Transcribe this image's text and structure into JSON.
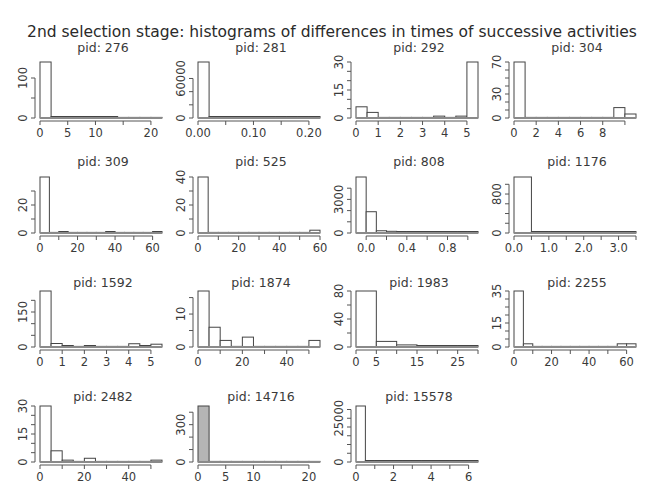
{
  "chart_data": {
    "type": "bar",
    "title": "2nd selection stage: histograms of differences in times of successive activities",
    "layout": {
      "rows": 4,
      "cols": 4,
      "grid": false,
      "legend": "none"
    },
    "panels": [
      {
        "title": "pid:  276",
        "xlim": [
          0,
          22
        ],
        "ylim": [
          0,
          140
        ],
        "xticks": [
          0,
          5,
          10,
          15,
          20
        ],
        "xtick_labels": [
          "0",
          "5",
          "10",
          "",
          "20"
        ],
        "yticks": [
          0,
          50,
          100
        ],
        "ytick_labels": [
          "0",
          "",
          "100"
        ],
        "bin_edges": [
          0,
          2,
          4,
          6,
          8,
          10,
          12,
          14,
          16,
          18,
          20,
          22
        ],
        "counts": [
          140,
          1,
          1,
          1,
          1,
          1,
          1,
          0,
          0,
          0,
          0
        ]
      },
      {
        "title": "pid:  281",
        "xlim": [
          0,
          0.22
        ],
        "ylim": [
          0,
          85000
        ],
        "xticks": [
          0,
          0.05,
          0.1,
          0.15,
          0.2
        ],
        "xtick_labels": [
          "0.00",
          "",
          "0.10",
          "",
          "0.20"
        ],
        "yticks": [
          0,
          20000,
          40000,
          60000
        ],
        "ytick_labels": [
          "0",
          "",
          "",
          "60000"
        ],
        "bin_edges": [
          0,
          0.02,
          0.04,
          0.06,
          0.08,
          0.1,
          0.12,
          0.14,
          0.16,
          0.18,
          0.2,
          0.22
        ],
        "counts": [
          85000,
          200,
          500,
          300,
          100,
          50,
          30,
          20,
          10,
          10,
          10
        ]
      },
      {
        "title": "pid:  292",
        "xlim": [
          0,
          5.5
        ],
        "ylim": [
          0,
          30
        ],
        "xticks": [
          0,
          1,
          2,
          3,
          4,
          5
        ],
        "xtick_labels": [
          "0",
          "1",
          "2",
          "3",
          "4",
          "5"
        ],
        "yticks": [
          0,
          5,
          10,
          15,
          20,
          25,
          30
        ],
        "ytick_labels": [
          "0",
          "",
          "",
          "15",
          "",
          "",
          "30"
        ],
        "bin_edges": [
          0,
          0.5,
          1,
          1.5,
          2,
          2.5,
          3,
          3.5,
          4,
          4.5,
          5,
          5.5
        ],
        "counts": [
          6,
          3,
          0,
          0,
          0,
          0,
          0,
          1,
          0,
          1,
          30
        ]
      },
      {
        "title": "pid:  304",
        "xlim": [
          0,
          11
        ],
        "ylim": [
          0,
          70
        ],
        "xticks": [
          0,
          2,
          4,
          6,
          8,
          10
        ],
        "xtick_labels": [
          "0",
          "2",
          "4",
          "6",
          "8",
          ""
        ],
        "yticks": [
          0,
          10,
          20,
          30,
          40,
          50,
          60,
          70
        ],
        "ytick_labels": [
          "0",
          "",
          "",
          "30",
          "",
          "",
          "",
          "70"
        ],
        "bin_edges": [
          0,
          1,
          2,
          3,
          4,
          5,
          6,
          7,
          8,
          9,
          10,
          11
        ],
        "counts": [
          70,
          0,
          0,
          0,
          0,
          0,
          0,
          0,
          0,
          13,
          5
        ]
      },
      {
        "title": "pid:  309",
        "xlim": [
          0,
          65
        ],
        "ylim": [
          0,
          40
        ],
        "xticks": [
          0,
          10,
          20,
          30,
          40,
          50,
          60
        ],
        "xtick_labels": [
          "0",
          "",
          "20",
          "",
          "40",
          "",
          "60"
        ],
        "yticks": [
          0,
          10,
          20,
          30
        ],
        "ytick_labels": [
          "0",
          "",
          "20",
          ""
        ],
        "bin_edges": [
          0,
          5,
          10,
          15,
          20,
          25,
          30,
          35,
          40,
          45,
          50,
          55,
          60,
          65
        ],
        "counts": [
          40,
          0,
          1,
          0,
          0,
          0,
          0,
          1,
          0,
          0,
          0,
          0,
          1
        ]
      },
      {
        "title": "pid:  525",
        "xlim": [
          0,
          60
        ],
        "ylim": [
          0,
          40
        ],
        "xticks": [
          0,
          10,
          20,
          30,
          40,
          50,
          60
        ],
        "xtick_labels": [
          "0",
          "",
          "20",
          "",
          "40",
          "",
          "60"
        ],
        "yticks": [
          0,
          10,
          20,
          30,
          40
        ],
        "ytick_labels": [
          "0",
          "",
          "20",
          "",
          "40"
        ],
        "bin_edges": [
          0,
          5,
          10,
          15,
          20,
          25,
          30,
          35,
          40,
          45,
          50,
          55,
          60
        ],
        "counts": [
          40,
          0,
          0,
          0,
          0,
          0,
          0,
          0,
          0,
          0,
          0,
          2
        ]
      },
      {
        "title": "pid:  808",
        "xlim": [
          -0.1,
          1.1
        ],
        "ylim": [
          0,
          5000
        ],
        "xticks": [
          0.0,
          0.2,
          0.4,
          0.6,
          0.8,
          1.0
        ],
        "xtick_labels": [
          "0.0",
          "",
          "0.4",
          "",
          "0.8",
          ""
        ],
        "yticks": [
          0,
          1000,
          2000,
          3000,
          4000
        ],
        "ytick_labels": [
          "0",
          "",
          "",
          "3000",
          ""
        ],
        "bin_edges": [
          -0.1,
          0.0,
          0.1,
          0.2,
          0.3,
          0.4,
          0.5,
          0.6,
          0.7,
          0.8,
          0.9,
          1.0,
          1.1
        ],
        "counts": [
          5000,
          1900,
          200,
          150,
          50,
          100,
          20,
          10,
          10,
          10,
          10,
          10
        ]
      },
      {
        "title": "pid:  1176",
        "xlim": [
          0,
          3.5
        ],
        "ylim": [
          0,
          1150
        ],
        "xticks": [
          0.0,
          0.5,
          1.0,
          1.5,
          2.0,
          2.5,
          3.0,
          3.5
        ],
        "xtick_labels": [
          "0.0",
          "",
          "1.0",
          "",
          "2.0",
          "",
          "3.0",
          ""
        ],
        "yticks": [
          0,
          200,
          400,
          600,
          800,
          1000
        ],
        "ytick_labels": [
          "0",
          "",
          "",
          "",
          "800",
          ""
        ],
        "bin_edges": [
          0,
          0.5,
          1.0,
          1.5,
          2.0,
          2.5,
          3.0,
          3.5
        ],
        "counts": [
          1150,
          1,
          1,
          1,
          1,
          1,
          30
        ]
      },
      {
        "title": "pid:  1592",
        "xlim": [
          0,
          5.5
        ],
        "ylim": [
          0,
          240
        ],
        "xticks": [
          0,
          1,
          2,
          3,
          4,
          5
        ],
        "xtick_labels": [
          "0",
          "1",
          "2",
          "3",
          "4",
          "5"
        ],
        "yticks": [
          0,
          50,
          100,
          150,
          200
        ],
        "ytick_labels": [
          "0",
          "",
          "",
          "150",
          ""
        ],
        "bin_edges": [
          0,
          0.5,
          1,
          1.5,
          2,
          2.5,
          3,
          3.5,
          4,
          4.5,
          5,
          5.5
        ],
        "counts": [
          240,
          15,
          3,
          0,
          3,
          0,
          0,
          0,
          14,
          3,
          12
        ]
      },
      {
        "title": "pid:  1874",
        "xlim": [
          0,
          55
        ],
        "ylim": [
          0,
          17
        ],
        "xticks": [
          0,
          10,
          20,
          30,
          40,
          50
        ],
        "xtick_labels": [
          "0",
          "",
          "20",
          "",
          "40",
          ""
        ],
        "yticks": [
          0,
          5,
          10,
          15
        ],
        "ytick_labels": [
          "0",
          "",
          "10",
          ""
        ],
        "bin_edges": [
          0,
          5,
          10,
          15,
          20,
          25,
          30,
          35,
          40,
          45,
          50,
          55
        ],
        "counts": [
          17,
          6,
          2,
          0,
          3,
          0,
          0,
          0,
          0,
          0,
          2
        ]
      },
      {
        "title": "pid:  1983",
        "xlim": [
          0,
          30
        ],
        "ylim": [
          0,
          80
        ],
        "xticks": [
          0,
          5,
          10,
          15,
          20,
          25,
          30
        ],
        "xtick_labels": [
          "0",
          "5",
          "",
          "15",
          "",
          "25",
          ""
        ],
        "yticks": [
          0,
          20,
          40,
          60,
          80
        ],
        "ytick_labels": [
          "0",
          "",
          "40",
          "",
          "80"
        ],
        "bin_edges": [
          0,
          5,
          10,
          15,
          20,
          25,
          30
        ],
        "counts": [
          80,
          8,
          3,
          2,
          2,
          1
        ]
      },
      {
        "title": "pid:  2255",
        "xlim": [
          0,
          65
        ],
        "ylim": [
          0,
          35
        ],
        "xticks": [
          0,
          10,
          20,
          30,
          40,
          50,
          60
        ],
        "xtick_labels": [
          "0",
          "",
          "20",
          "",
          "40",
          "",
          "60"
        ],
        "yticks": [
          0,
          5,
          10,
          15,
          20,
          25,
          30,
          35
        ],
        "ytick_labels": [
          "0",
          "",
          "",
          "15",
          "",
          "",
          "",
          "35"
        ],
        "bin_edges": [
          0,
          5,
          10,
          15,
          20,
          25,
          30,
          35,
          40,
          45,
          50,
          55,
          60,
          65
        ],
        "counts": [
          35,
          2,
          0,
          0,
          0,
          0,
          0,
          0,
          0,
          0,
          0,
          2,
          2
        ]
      },
      {
        "title": "pid:  2482",
        "xlim": [
          0,
          55
        ],
        "ylim": [
          0,
          30
        ],
        "xticks": [
          0,
          10,
          20,
          30,
          40,
          50
        ],
        "xtick_labels": [
          "0",
          "",
          "20",
          "",
          "40",
          ""
        ],
        "yticks": [
          0,
          5,
          10,
          15,
          20,
          25,
          30
        ],
        "ytick_labels": [
          "0",
          "",
          "",
          "15",
          "",
          "",
          "30"
        ],
        "bin_edges": [
          0,
          5,
          10,
          15,
          20,
          25,
          30,
          35,
          40,
          45,
          50,
          55
        ],
        "counts": [
          30,
          6,
          1,
          0,
          2,
          0,
          0,
          0,
          0,
          0,
          1
        ]
      },
      {
        "title": "pid:  14716",
        "xlim": [
          0,
          22
        ],
        "ylim": [
          0,
          450
        ],
        "xticks": [
          0,
          5,
          10,
          15,
          20
        ],
        "xtick_labels": [
          "0",
          "5",
          "10",
          "",
          "20"
        ],
        "yticks": [
          0,
          100,
          200,
          300,
          400
        ],
        "ytick_labels": [
          "0",
          "",
          "",
          "300",
          ""
        ],
        "bin_edges": [
          0,
          2,
          4,
          6,
          8,
          10,
          12,
          14,
          16,
          18,
          20,
          22
        ],
        "counts": [
          450,
          0,
          0,
          0,
          0,
          0,
          0,
          0,
          0,
          0,
          0
        ],
        "shaded": true
      },
      {
        "title": "pid:  15578",
        "xlim": [
          0,
          6.5
        ],
        "ylim": [
          0,
          32000
        ],
        "xticks": [
          0,
          1,
          2,
          3,
          4,
          5,
          6
        ],
        "xtick_labels": [
          "0",
          "",
          "2",
          "",
          "4",
          "",
          "6"
        ],
        "yticks": [
          0,
          5000,
          10000,
          15000,
          20000,
          25000,
          30000
        ],
        "ytick_labels": [
          "0",
          "",
          "",
          "",
          "",
          "25000",
          ""
        ],
        "bin_edges": [
          0,
          0.5,
          1,
          1.5,
          2,
          2.5,
          3,
          3.5,
          4,
          4.5,
          5,
          5.5,
          6,
          6.5
        ],
        "counts": [
          32000,
          10,
          5,
          5,
          5,
          5,
          5,
          5,
          5,
          5,
          5,
          5,
          5
        ]
      }
    ]
  }
}
